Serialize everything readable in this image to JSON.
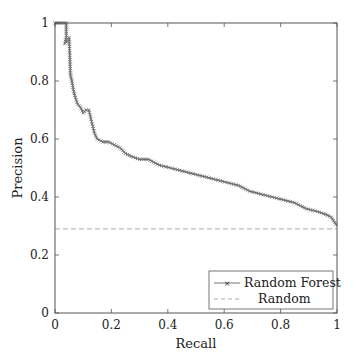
{
  "chart_data": {
    "type": "line",
    "title": "",
    "xlabel": "Recall",
    "ylabel": "Precision",
    "xlim": [
      0,
      1
    ],
    "ylim": [
      0,
      1
    ],
    "xticks": [
      "0",
      "0.2",
      "0.4",
      "0.6",
      "0.8",
      "1"
    ],
    "yticks": [
      "0",
      "0.2",
      "0.4",
      "0.6",
      "0.8",
      "1"
    ],
    "grid": false,
    "legend_position": "lower right",
    "series": [
      {
        "name": "Random Forest",
        "style": "solid line with x markers",
        "color": "#6e6e6e",
        "x": [
          0.0,
          0.02,
          0.04,
          0.04,
          0.035,
          0.045,
          0.05,
          0.055,
          0.06,
          0.065,
          0.07,
          0.08,
          0.09,
          0.1,
          0.11,
          0.12,
          0.13,
          0.14,
          0.15,
          0.17,
          0.19,
          0.21,
          0.23,
          0.25,
          0.27,
          0.3,
          0.33,
          0.37,
          0.41,
          0.45,
          0.49,
          0.53,
          0.57,
          0.61,
          0.65,
          0.69,
          0.73,
          0.77,
          0.81,
          0.85,
          0.89,
          0.93,
          0.96,
          0.98,
          1.0
        ],
        "values": [
          1.0,
          1.0,
          1.0,
          0.95,
          0.93,
          0.94,
          0.95,
          0.82,
          0.8,
          0.77,
          0.75,
          0.72,
          0.71,
          0.69,
          0.7,
          0.7,
          0.66,
          0.62,
          0.6,
          0.59,
          0.59,
          0.58,
          0.57,
          0.55,
          0.54,
          0.53,
          0.53,
          0.51,
          0.5,
          0.49,
          0.48,
          0.47,
          0.46,
          0.45,
          0.44,
          0.42,
          0.41,
          0.4,
          0.39,
          0.38,
          0.36,
          0.35,
          0.34,
          0.33,
          0.3
        ]
      },
      {
        "name": "Random",
        "style": "dashed",
        "color": "#aaaaaa",
        "x": [
          0,
          1
        ],
        "values": [
          0.29,
          0.29
        ]
      }
    ]
  }
}
